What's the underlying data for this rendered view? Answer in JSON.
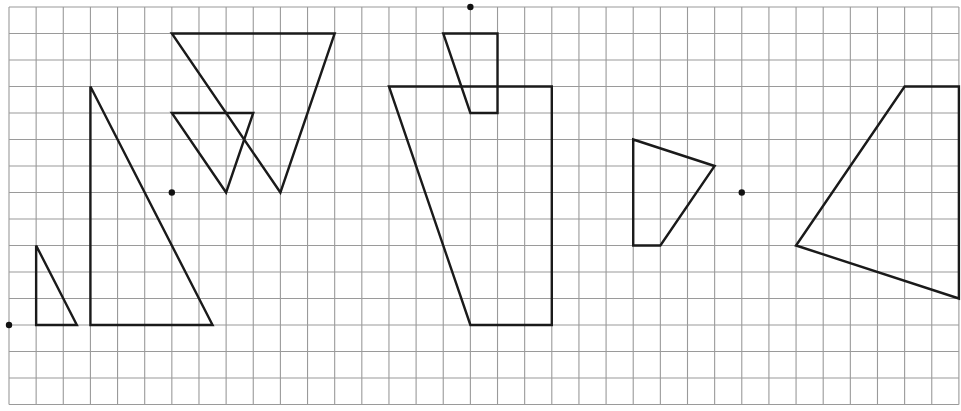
{
  "diagram": {
    "type": "grid-geometry",
    "grid": {
      "origin_px": [
        9,
        7
      ],
      "cell_w": 27.14,
      "cell_h": 26.5,
      "cols": 35,
      "rows": 15,
      "line_color": "#9a9a9a"
    },
    "stroke_color": "#1a1a1a",
    "dots": [
      {
        "id": "center-dot-1",
        "at": [
          0,
          12
        ]
      },
      {
        "id": "center-dot-2",
        "at": [
          6,
          7
        ]
      },
      {
        "id": "center-dot-3",
        "at": [
          17,
          0
        ]
      },
      {
        "id": "center-dot-4",
        "at": [
          27,
          7
        ]
      }
    ],
    "shapes": [
      {
        "id": "small-right-triangle",
        "points": [
          [
            1,
            9
          ],
          [
            1,
            12
          ],
          [
            2.5,
            12
          ]
        ]
      },
      {
        "id": "large-right-triangle",
        "points": [
          [
            3,
            3
          ],
          [
            3,
            12
          ],
          [
            7.5,
            12
          ]
        ]
      },
      {
        "id": "large-inverted-triangle",
        "points": [
          [
            6,
            1
          ],
          [
            12,
            1
          ],
          [
            10,
            7
          ]
        ]
      },
      {
        "id": "small-inverted-triangle",
        "points": [
          [
            6,
            4
          ],
          [
            9,
            4
          ],
          [
            8,
            7
          ]
        ]
      },
      {
        "id": "small-trapezoid",
        "points": [
          [
            16,
            1
          ],
          [
            18,
            1
          ],
          [
            18,
            4
          ],
          [
            17,
            4
          ]
        ]
      },
      {
        "id": "large-trapezoid",
        "points": [
          [
            14,
            3
          ],
          [
            20,
            3
          ],
          [
            20,
            12
          ],
          [
            17,
            12
          ]
        ]
      },
      {
        "id": "small-quadrilateral",
        "points": [
          [
            23,
            5
          ],
          [
            26,
            6
          ],
          [
            24,
            9
          ],
          [
            23,
            9
          ]
        ]
      },
      {
        "id": "large-quadrilateral",
        "points": [
          [
            29,
            9
          ],
          [
            33,
            3
          ],
          [
            35,
            3
          ],
          [
            35,
            11
          ]
        ]
      }
    ]
  }
}
